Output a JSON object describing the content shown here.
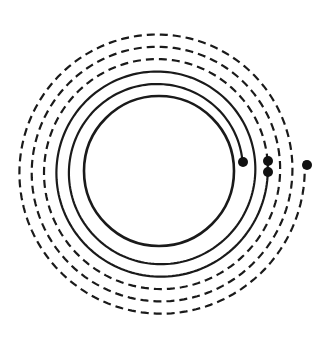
{
  "diagram": {
    "type": "concentric spiral diagram",
    "canvas": {
      "width": 325,
      "height": 340,
      "background": "#ffffff"
    },
    "center": {
      "x": 159,
      "y": 171
    },
    "stroke_color": "#1a1a1a",
    "dot_color": "#111111",
    "inner_circle": {
      "radius": 75,
      "style": "solid",
      "stroke_width": 2.6
    },
    "spirals": [
      {
        "name": "solid-spiral",
        "style": "solid",
        "stroke_width": 2.2,
        "start_radius": 84,
        "growth_per_turn": 12.5,
        "turns": 2,
        "start_angle_deg": -5,
        "start_dot": true,
        "end_dot": true
      },
      {
        "name": "dashed-spiral",
        "style": "dashed",
        "dash": "8 5",
        "stroke_width": 2.2,
        "start_radius": 109,
        "growth_per_turn": 12.3,
        "turns": 3,
        "start_angle_deg": -5,
        "start_dot": true,
        "end_dot": true
      }
    ],
    "dots": [
      {
        "label": "solid-spiral-inner-end",
        "x": 243,
        "y": 162,
        "r": 5
      },
      {
        "label": "dashed-spiral-inner-end",
        "x": 268,
        "y": 161,
        "r": 5
      },
      {
        "label": "solid-spiral-outer-end",
        "x": 268,
        "y": 172,
        "r": 5
      },
      {
        "label": "dashed-spiral-outer-end",
        "x": 307,
        "y": 165,
        "r": 5
      }
    ]
  }
}
